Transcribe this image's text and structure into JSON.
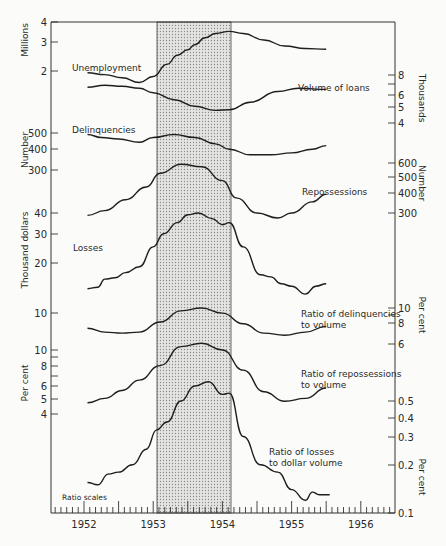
{
  "chart_data": {
    "type": "line",
    "title": "",
    "note": "Ratio scales",
    "x_axis": {
      "tick_labels": [
        "1952",
        "1953",
        "1954",
        "1955",
        "1956"
      ],
      "range": [
        1951.5,
        1956.5
      ],
      "minor_ticks_per_year": 12
    },
    "shaded_period": {
      "from": 1953.0,
      "to": 1954.1,
      "description": "recession period (stippled)"
    },
    "left_axes": [
      {
        "unit": "Millions",
        "ticks": [
          "4",
          "3",
          "2"
        ]
      },
      {
        "unit": "Number",
        "ticks": [
          "500",
          "400",
          "300"
        ]
      },
      {
        "unit": "Thousand dollars",
        "ticks": [
          "40",
          "30",
          "20",
          "10"
        ]
      },
      {
        "unit": "Per cent",
        "ticks": [
          "10",
          "8",
          "6",
          "5",
          "4"
        ]
      }
    ],
    "right_axes": [
      {
        "unit": "Thousands",
        "ticks": [
          "8",
          "6",
          "5",
          "4"
        ]
      },
      {
        "unit": "Number",
        "ticks": [
          "600",
          "500",
          "400",
          "300"
        ]
      },
      {
        "unit": "Per cent",
        "ticks": [
          "10",
          "8",
          "6"
        ]
      },
      {
        "unit": "Per cent",
        "ticks": [
          "0.5",
          "0.4",
          "0.3",
          "0.2",
          "0.1"
        ]
      }
    ],
    "series": [
      {
        "name": "Unemployment",
        "unit": "Millions",
        "label_pos": [
          100,
          71
        ],
        "x": [
          1952.05,
          1952.3,
          1952.55,
          1952.8,
          1953.0,
          1953.2,
          1953.35,
          1953.5,
          1953.6,
          1953.75,
          1953.9,
          1954.1,
          1954.3,
          1954.6,
          1954.9,
          1955.2,
          1955.5
        ],
        "values": [
          1.95,
          1.9,
          1.82,
          1.7,
          1.85,
          2.2,
          2.5,
          2.7,
          2.9,
          3.2,
          3.4,
          3.5,
          3.4,
          3.1,
          2.85,
          2.75,
          2.72
        ]
      },
      {
        "name": "Volume of loans",
        "unit": "Thousands",
        "label_pos": [
          298,
          91
        ],
        "x": [
          1952.05,
          1952.3,
          1952.55,
          1952.8,
          1953.0,
          1953.3,
          1953.6,
          1953.9,
          1954.1,
          1954.4,
          1954.8,
          1955.1,
          1955.5
        ],
        "values": [
          6.7,
          6.9,
          6.8,
          6.6,
          6.2,
          5.6,
          5.1,
          4.8,
          4.85,
          5.4,
          6.3,
          6.6,
          6.5
        ]
      },
      {
        "name": "Delinquencies",
        "unit": "Number",
        "label_pos": [
          72,
          131
        ],
        "x": [
          1952.05,
          1952.25,
          1952.5,
          1952.8,
          1953.0,
          1953.3,
          1953.6,
          1953.9,
          1954.1,
          1954.4,
          1954.7,
          1955.0,
          1955.3,
          1955.5
        ],
        "values": [
          490,
          470,
          460,
          440,
          470,
          490,
          470,
          430,
          400,
          370,
          370,
          380,
          400,
          420
        ]
      },
      {
        "name": "Repossessions",
        "unit": "Number",
        "label_pos": [
          302,
          193
        ],
        "x": [
          1952.05,
          1952.3,
          1952.6,
          1952.9,
          1953.1,
          1953.4,
          1953.7,
          1954.0,
          1954.2,
          1954.5,
          1954.8,
          1955.0,
          1955.3,
          1955.5
        ],
        "values": [
          290,
          310,
          360,
          430,
          520,
          590,
          570,
          470,
          370,
          300,
          280,
          300,
          350,
          390
        ]
      },
      {
        "name": "Losses",
        "unit": "Thousand dollars",
        "label_pos": [
          73,
          249
        ],
        "x": [
          1952.05,
          1952.2,
          1952.3,
          1952.45,
          1952.6,
          1952.8,
          1953.0,
          1953.15,
          1953.35,
          1953.5,
          1953.65,
          1953.85,
          1954.0,
          1954.1,
          1954.3,
          1954.55,
          1954.7,
          1954.85,
          1955.0,
          1955.2,
          1955.35,
          1955.5
        ],
        "values": [
          14,
          14.3,
          16,
          16.3,
          17.5,
          19,
          25,
          30,
          35,
          39,
          40,
          37,
          34,
          35,
          25,
          17,
          16.5,
          15,
          14.5,
          13,
          14.5,
          15
        ]
      },
      {
        "name": "Ratio of delinquencies to volume",
        "unit": "Per cent",
        "label_pos": [
          300,
          317
        ],
        "x": [
          1952.05,
          1952.3,
          1952.55,
          1952.8,
          1953.1,
          1953.4,
          1953.7,
          1954.0,
          1954.3,
          1954.6,
          1954.9,
          1955.2,
          1955.5
        ],
        "values": [
          7.5,
          7.1,
          7.0,
          7.1,
          8.2,
          9.6,
          10.0,
          9.3,
          8.0,
          7.0,
          6.8,
          7.1,
          7.7
        ]
      },
      {
        "name": "Ratio of repossessions to volume",
        "unit": "Per cent",
        "label_pos": [
          300,
          377
        ],
        "x": [
          1952.05,
          1952.3,
          1952.55,
          1952.8,
          1953.1,
          1953.4,
          1953.7,
          1954.0,
          1954.3,
          1954.6,
          1954.9,
          1955.2,
          1955.5
        ],
        "values": [
          4.7,
          5.0,
          5.6,
          6.5,
          8.0,
          10.5,
          11.0,
          10.0,
          7.5,
          5.5,
          4.8,
          5.0,
          5.8
        ]
      },
      {
        "name": "Ratio of losses to dollar volume",
        "unit": "Per cent",
        "label_pos": [
          290,
          457
        ],
        "x": [
          1952.05,
          1952.2,
          1952.35,
          1952.5,
          1952.7,
          1952.9,
          1953.05,
          1953.2,
          1953.4,
          1953.6,
          1953.8,
          1954.0,
          1954.1,
          1954.3,
          1954.55,
          1954.8,
          1955.0,
          1955.2,
          1955.3,
          1955.4,
          1955.55
        ],
        "values": [
          0.155,
          0.15,
          0.175,
          0.18,
          0.2,
          0.25,
          0.33,
          0.37,
          0.5,
          0.62,
          0.66,
          0.55,
          0.56,
          0.3,
          0.2,
          0.18,
          0.14,
          0.12,
          0.135,
          0.13,
          0.13
        ]
      }
    ]
  }
}
